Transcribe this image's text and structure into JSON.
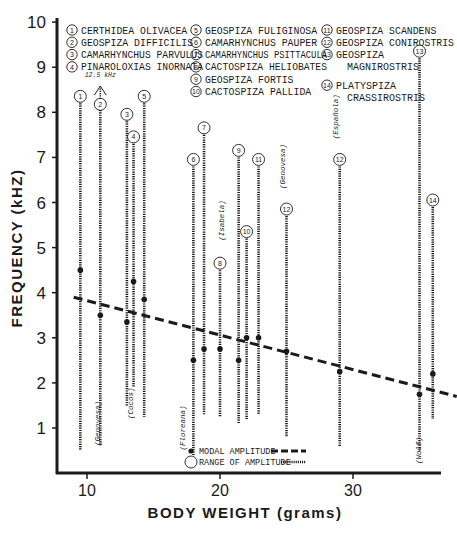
{
  "chart_data": {
    "type": "scatter",
    "title": "",
    "xlabel": "BODY WEIGHT (grams)",
    "ylabel": "FREQUENCY (kHZ)",
    "xlim": [
      8,
      37
    ],
    "ylim": [
      0,
      10
    ],
    "x_ticks": [
      10,
      20,
      30
    ],
    "y_ticks": [
      1,
      2,
      3,
      4,
      5,
      6,
      7,
      8,
      9,
      10
    ],
    "grid": false,
    "legend_species": [
      {
        "num": "1",
        "name": "CERTHIDEA OLIVACEA"
      },
      {
        "num": "2",
        "name": "GEOSPIZA DIFFICILIS"
      },
      {
        "num": "3",
        "name": "CAMARHYNCHUS PARVULUS"
      },
      {
        "num": "4",
        "name": "PINAROLOXIAS INORNATA"
      },
      {
        "num": "5",
        "name": "GEOSPIZA FULIGINOSA"
      },
      {
        "num": "6",
        "name": "CAMARHYNCHUS PAUPER"
      },
      {
        "num": "7",
        "name": "CAMARHYNCHUS PSITTACULA"
      },
      {
        "num": "8",
        "name": "CACTOSPIZA HELIOBATES"
      },
      {
        "num": "9",
        "name": "GEOSPIZA FORTIS"
      },
      {
        "num": "10",
        "name": "CACTOSPIZA PALLIDA"
      },
      {
        "num": "11",
        "name": "GEOSPIZA SCANDENS"
      },
      {
        "num": "12",
        "name": "GEOSPIZA CONIROSTRIS"
      },
      {
        "num": "13",
        "name": "GEOSPIZA MAGNIROSTRIS"
      },
      {
        "num": "14",
        "name": "PLATYSPIZA CRASSIROSTRIS"
      }
    ],
    "series": [
      {
        "name": "Range of amplitude",
        "style": "dotted vertical bars",
        "points": [
          {
            "species": "1",
            "weight": 9.5,
            "low": 0.5,
            "high": 8.2,
            "modal": 4.5,
            "island": ""
          },
          {
            "species": "2",
            "weight": 11.0,
            "low": 0.6,
            "high": 12.5,
            "modal": 3.5,
            "island": "Genovesa",
            "note": "12.5 kHz"
          },
          {
            "species": "3",
            "weight": 13.0,
            "low": 1.5,
            "high": 7.8,
            "modal": 3.35,
            "island": ""
          },
          {
            "species": "4",
            "weight": 13.5,
            "low": 1.9,
            "high": 7.3,
            "modal": 4.25,
            "island": "Cocos"
          },
          {
            "species": "5",
            "weight": 14.3,
            "low": 1.25,
            "high": 8.2,
            "modal": 3.85,
            "island": ""
          },
          {
            "species": "6",
            "weight": 18.0,
            "low": 0.4,
            "high": 6.8,
            "modal": 2.5,
            "island": "Floreana"
          },
          {
            "species": "7",
            "weight": 18.8,
            "low": 1.3,
            "high": 7.5,
            "modal": 2.75,
            "island": ""
          },
          {
            "species": "8",
            "weight": 20.0,
            "low": 1.25,
            "high": 4.5,
            "modal": 2.75,
            "island": "Isabela"
          },
          {
            "species": "9",
            "weight": 21.4,
            "low": 1.1,
            "high": 7.0,
            "modal": 2.5,
            "island": ""
          },
          {
            "species": "10",
            "weight": 22.0,
            "low": 1.2,
            "high": 5.2,
            "modal": 3.0,
            "island": ""
          },
          {
            "species": "11",
            "weight": 22.9,
            "low": 1.3,
            "high": 6.8,
            "modal": 3.0,
            "island": ""
          },
          {
            "species": "12",
            "weight": 25.0,
            "low": 0.8,
            "high": 5.7,
            "modal": 2.7,
            "island": "Genovesa"
          },
          {
            "species": "12",
            "weight": 29.0,
            "low": 0.6,
            "high": 6.8,
            "modal": 2.25,
            "island": "Española"
          },
          {
            "species": "13",
            "weight": 35.0,
            "low": 0.5,
            "high": 9.2,
            "modal": 1.75,
            "island": "Wolf"
          },
          {
            "species": "14",
            "weight": 36.0,
            "low": 1.2,
            "high": 5.9,
            "modal": 2.2,
            "island": ""
          }
        ]
      },
      {
        "name": "Modal amplitude trend",
        "style": "dashed line",
        "x": [
          9.0,
          37.8
        ],
        "y": [
          3.9,
          1.7
        ]
      }
    ],
    "legend": {
      "modal": "MODAL AMPLITUDE",
      "range": "RANGE OF AMPLITUDE",
      "position": "lower center"
    },
    "annotations": [
      "12.5 kHz"
    ],
    "caption_partial": "FIGURE 8. Relationship between modal amplitude frequency and body weight..."
  },
  "labels": {
    "xlabel": "BODY  WEIGHT (grams)",
    "ylabel": "FREQUENCY (kHZ)",
    "legend_modal": "MODAL AMPLITUDE",
    "legend_range": "RANGE OF AMPLITUDE",
    "arrow_note": "12.5 kHz"
  },
  "colors": {
    "ink": "#1a1a1a",
    "background": "#ffffff"
  }
}
